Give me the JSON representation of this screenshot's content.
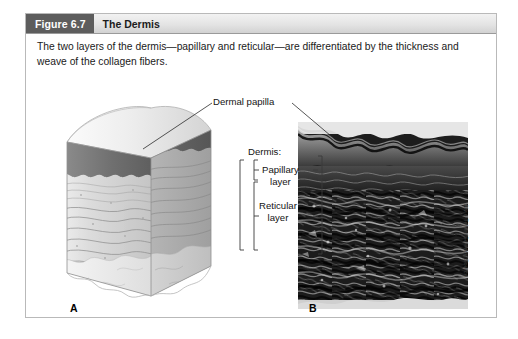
{
  "figure": {
    "number_label": "Figure 6.7",
    "title": "The Dermis",
    "caption": "The two layers of the dermis—papillary and reticular—are differentiated by the thickness and weave of the collagen fibers."
  },
  "labels": {
    "dermal_papilla": "Dermal papilla",
    "dermis": "Dermis:",
    "papillary_line1": "Papillary",
    "papillary_line2": "layer",
    "reticular_line1": "Reticular",
    "reticular_line2": "layer"
  },
  "panels": {
    "a_letter": "A",
    "b_letter": "B"
  },
  "credit": {
    "text": "Alvin Telser/Science Source"
  },
  "colors": {
    "header_tab": "#5d5d5d",
    "header_bar": "#e4e4e4",
    "frame_border": "#b9b9b9",
    "text": "#141414",
    "epidermis": "#7d7d7d",
    "dermis": "#cfcfcf",
    "hypodermis": "#e8e8e8"
  }
}
